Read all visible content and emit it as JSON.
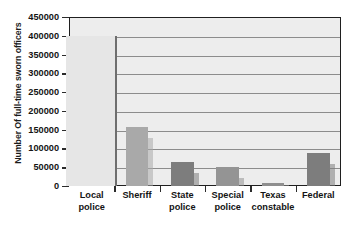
{
  "chart_data": {
    "type": "bar",
    "title": "",
    "xlabel": "",
    "ylabel": "Number Of full-time sworn officers",
    "categories": [
      "Local police",
      "Sheriff",
      "State police",
      "Special police",
      "Texas constable",
      "Federal"
    ],
    "category_lines": [
      [
        "Local",
        "police"
      ],
      [
        "Sheriff",
        ""
      ],
      [
        "State",
        "police"
      ],
      [
        "Special",
        "police"
      ],
      [
        "Texas",
        "constable"
      ],
      [
        "Federal",
        ""
      ]
    ],
    "values": [
      400000,
      157000,
      65000,
      50000,
      8000,
      88000
    ],
    "bar_colors": [
      "#e6e6e6",
      "#a9a9a9",
      "#7d7d7d",
      "#949494",
      "#8f8f8f",
      "#7d7d7d"
    ],
    "ylim": [
      0,
      450000
    ],
    "ytick_values": [
      0,
      50000,
      100000,
      150000,
      200000,
      250000,
      300000,
      350000,
      400000,
      450000
    ],
    "ytick_labels": [
      "0",
      "50000",
      "100000",
      "150000",
      "200000",
      "250000",
      "300000",
      "350000",
      "400000",
      "450000"
    ],
    "grid": true,
    "grid_axis": "y",
    "legend": "none",
    "plot_background": "#ededed",
    "axis_color": "#1f1f1f",
    "gridline_color": "#8c8c8c"
  }
}
